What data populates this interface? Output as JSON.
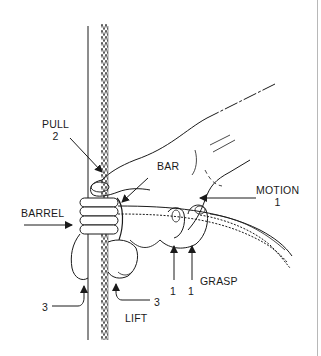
{
  "figure": {
    "labels": {
      "pull": "PULL",
      "pull_step": "2",
      "bar": "BAR",
      "motion": "MOTION",
      "motion_step": "1",
      "barrel": "BARREL",
      "grasp": "GRASP",
      "grasp_step_a": "1",
      "grasp_step_b": "1",
      "lift": "LIFT",
      "left_step": "3",
      "lift_step": "3"
    },
    "colors": {
      "ink": "#1a1a1a",
      "background": "#ffffff",
      "frame": "#b8b8b8"
    }
  }
}
